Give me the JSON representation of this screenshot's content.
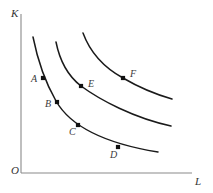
{
  "chart_data": {
    "type": "line",
    "title": "",
    "xlabel": "L",
    "ylabel": "K",
    "origin_label": "O",
    "grid": false,
    "legend": null,
    "axis_color": "#8a8a8a",
    "curve_color": "#1a1a1a",
    "marker_color": "#111111",
    "axes": {
      "x_axis": {
        "x_start": 21,
        "x_end": 192,
        "y": 173
      },
      "y_axis": {
        "x": 21,
        "y_top": 14,
        "y_bottom": 173
      }
    },
    "series": [
      {
        "name": "isoquant-1",
        "path": "M 33,37 C 38,62 44,80 56,101 C 68,122 96,142 158,152",
        "points": [
          {
            "label": "A",
            "x": 43,
            "y": 78,
            "label_x": 31,
            "label_y": 74
          },
          {
            "label": "B",
            "x": 57,
            "y": 102,
            "label_x": 45,
            "label_y": 99
          },
          {
            "label": "C",
            "x": 78,
            "y": 125,
            "label_x": 69,
            "label_y": 127
          },
          {
            "label": "D",
            "x": 118,
            "y": 147,
            "label_x": 110,
            "label_y": 150
          }
        ]
      },
      {
        "name": "isoquant-2",
        "path": "M 56,42 C 60,62 68,76 81,86 C 100,100 134,118 171,126",
        "points": [
          {
            "label": "E",
            "x": 81,
            "y": 86,
            "label_x": 88,
            "label_y": 79
          }
        ]
      },
      {
        "name": "isoquant-3",
        "path": "M 83,33 C 90,52 103,67 123,78 C 140,88 158,95 172,99",
        "points": [
          {
            "label": "F",
            "x": 123,
            "y": 78,
            "label_x": 130,
            "label_y": 69
          }
        ]
      }
    ],
    "labels": {
      "y_axis_label": {
        "text": "K",
        "x": 11,
        "y": 8
      },
      "x_axis_label": {
        "text": "L",
        "x": 195,
        "y": 176
      },
      "origin": {
        "text": "O",
        "x": 11,
        "y": 165
      }
    }
  }
}
